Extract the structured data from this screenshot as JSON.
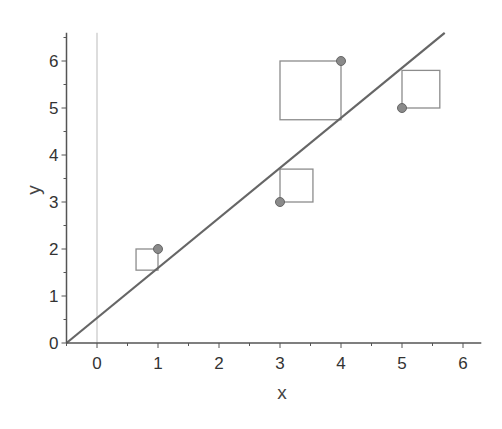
{
  "chart_data": {
    "type": "scatter",
    "title": "",
    "xlabel": "x",
    "ylabel": "y",
    "xlim": [
      -0.5,
      6.3
    ],
    "ylim": [
      0,
      6.6
    ],
    "x_ticks": [
      "0",
      "1",
      "2",
      "3",
      "4",
      "5",
      "6"
    ],
    "y_ticks": [
      "0",
      "1",
      "2",
      "3",
      "4",
      "5",
      "6"
    ],
    "grid": false,
    "reference_line_x": 0,
    "points": [
      {
        "x": 1,
        "y": 2
      },
      {
        "x": 3,
        "y": 3
      },
      {
        "x": 4,
        "y": 6
      },
      {
        "x": 5,
        "y": 5
      }
    ],
    "fit_line": {
      "x0": -0.5,
      "y0": 0,
      "x1": 5.7,
      "y1": 6.6
    },
    "residual_squares": [
      {
        "x0": 0.64,
        "x1": 1.0,
        "y0": 1.55,
        "y1": 2.0
      },
      {
        "x0": 3.0,
        "x1": 3.54,
        "y0": 3.0,
        "y1": 3.7
      },
      {
        "x0": 3.0,
        "x1": 4.0,
        "y0": 4.75,
        "y1": 6.0
      },
      {
        "x0": 5.0,
        "x1": 5.62,
        "y0": 5.0,
        "y1": 5.8
      }
    ],
    "colors": {
      "axis": "#555555",
      "fit_line": "#666666",
      "point_fill": "#8a8a8a",
      "point_stroke": "#666666",
      "square_stroke": "#8c8c8c",
      "reference_line": "#bbbbbb"
    }
  }
}
